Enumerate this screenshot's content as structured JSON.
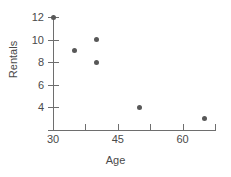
{
  "chart_data": {
    "type": "scatter",
    "title": "",
    "xlabel": "Age",
    "ylabel": "Rentals",
    "xlim": [
      28.85,
      67.5
    ],
    "ylim": [
      2.3,
      12.45
    ],
    "grid": false,
    "legend": null,
    "x_ticks": [
      {
        "value": 30,
        "label": "30"
      },
      {
        "value": 37.5,
        "label": ""
      },
      {
        "value": 45,
        "label": "45"
      },
      {
        "value": 52.5,
        "label": ""
      },
      {
        "value": 60,
        "label": "60"
      },
      {
        "value": 67.5,
        "label": ""
      }
    ],
    "y_ticks": [
      {
        "value": 12,
        "label": "12"
      },
      {
        "value": 10,
        "label": "10"
      },
      {
        "value": 8,
        "label": "8"
      },
      {
        "value": 6,
        "label": "6"
      },
      {
        "value": 4,
        "label": "4"
      }
    ],
    "x": [
      30,
      35,
      40,
      40,
      50,
      65
    ],
    "y": [
      12,
      9,
      10,
      8,
      4,
      3
    ],
    "points": [
      {
        "x": 30,
        "y": 12
      },
      {
        "x": 35,
        "y": 9
      },
      {
        "x": 40,
        "y": 10
      },
      {
        "x": 40,
        "y": 8
      },
      {
        "x": 50,
        "y": 4
      },
      {
        "x": 65,
        "y": 3
      }
    ],
    "colors": {
      "marker": "#585858",
      "axis": "#6e6e6e",
      "text": "#4a4a4a",
      "background": "#ffffff"
    }
  }
}
